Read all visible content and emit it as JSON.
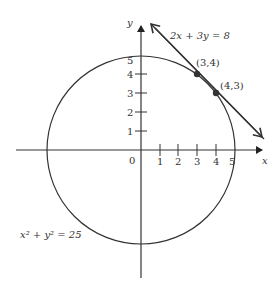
{
  "diagram": {
    "colors": {
      "stroke": "#333333",
      "text": "#444444",
      "background": "#ffffff"
    },
    "axes": {
      "x_label": "x",
      "y_label": "y",
      "origin_label": "0",
      "x_ticks": [
        "1",
        "2",
        "3",
        "4",
        "5"
      ],
      "y_ticks": [
        "1",
        "2",
        "3",
        "4",
        "5"
      ]
    },
    "circle": {
      "equation": "x² + y² = 25",
      "center": [
        0,
        0
      ],
      "radius": 5
    },
    "line": {
      "equation": "2x + 3y = 8"
    },
    "points": [
      {
        "label": "(3,4)",
        "x": 3,
        "y": 4
      },
      {
        "label": "(4,3)",
        "x": 4,
        "y": 3
      }
    ]
  }
}
